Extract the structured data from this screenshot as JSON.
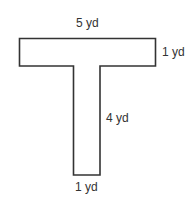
{
  "shape": {
    "name": "T-shape",
    "stroke_color": "#333333",
    "fill_color": "#ffffff"
  },
  "labels": {
    "top_width": "5 yd",
    "right_height": "1 yd",
    "stem_height": "4 yd",
    "bottom_width": "1 yd"
  }
}
